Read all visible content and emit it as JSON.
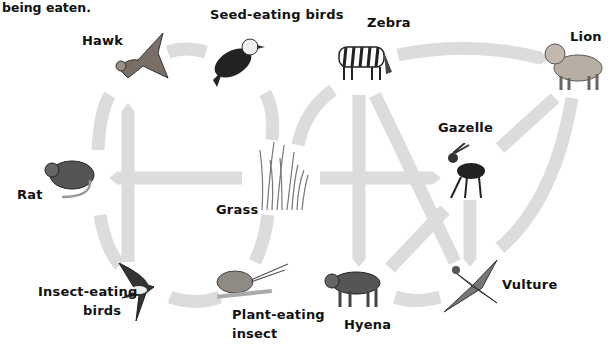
{
  "caption": "being eaten.",
  "arrow_color": "#dcdcdc",
  "organisms": {
    "hawk": "Hawk",
    "seed_birds": "Seed-eating birds",
    "zebra": "Zebra",
    "lion": "Lion",
    "rat": "Rat",
    "grass": "Grass",
    "gazelle": "Gazelle",
    "insect_birds_1": "Insect-eating",
    "insect_birds_2": "birds",
    "plant_insect_1": "Plant-eating",
    "plant_insect_2": "insect",
    "hyena": "Hyena",
    "vulture": "Vulture"
  },
  "links": [
    {
      "from": "Seed-eating birds",
      "to": "Hawk"
    },
    {
      "from": "Rat",
      "to": "Hawk"
    },
    {
      "from": "Insect-eating birds",
      "to": "Hawk"
    },
    {
      "from": "Grass",
      "to": "Seed-eating birds"
    },
    {
      "from": "Grass",
      "to": "Rat"
    },
    {
      "from": "Grass",
      "to": "Plant-eating insect"
    },
    {
      "from": "Plant-eating insect",
      "to": "Insect-eating birds"
    },
    {
      "from": "Rat",
      "to": "Insect-eating birds"
    },
    {
      "from": "Grass",
      "to": "Zebra"
    },
    {
      "from": "Grass",
      "to": "Gazelle"
    },
    {
      "from": "Zebra",
      "to": "Lion"
    },
    {
      "from": "Zebra",
      "to": "Hyena"
    },
    {
      "from": "Zebra",
      "to": "Vulture"
    },
    {
      "from": "Gazelle",
      "to": "Lion"
    },
    {
      "from": "Gazelle",
      "to": "Vulture"
    },
    {
      "from": "Gazelle",
      "to": "Hyena"
    },
    {
      "from": "Lion",
      "to": "Vulture"
    },
    {
      "from": "Hyena",
      "to": "Vulture"
    }
  ]
}
